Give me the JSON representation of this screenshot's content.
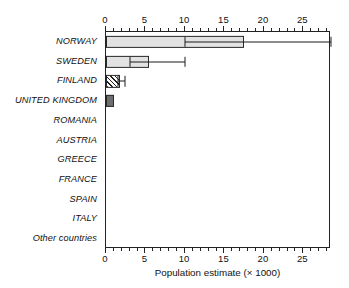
{
  "chart_data": {
    "type": "bar",
    "orientation": "horizontal",
    "title": "",
    "xlabel": "Population estimate (× 1000)",
    "ylabel": "",
    "xlim": [
      0,
      28.5
    ],
    "xticks": [
      0,
      5,
      10,
      15,
      20,
      25
    ],
    "xtick_labels": [
      "0",
      "5",
      "10",
      "15",
      "20",
      "25"
    ],
    "minor_tick_step": 1,
    "grid": false,
    "legend": "none",
    "axis_top": true,
    "axis_bottom": true,
    "categories": [
      "NORWAY",
      "SWEDEN",
      "FINLAND",
      "UNITED KINGDOM",
      "ROMANIA",
      "AUSTRIA",
      "GREECE",
      "FRANCE",
      "SPAIN",
      "ITALY",
      "Other countries"
    ],
    "values": [
      17.5,
      5.5,
      1.8,
      1.0,
      0,
      0,
      0,
      0,
      0,
      0,
      0
    ],
    "error_low": [
      10.0,
      3.0,
      1.5,
      null,
      null,
      null,
      null,
      null,
      null,
      null,
      null
    ],
    "error_high": [
      28.5,
      10.0,
      2.4,
      null,
      null,
      null,
      null,
      null,
      null,
      null,
      null
    ],
    "bar_styles": [
      "light-gray",
      "light-gray",
      "diagonal-hatch",
      "dark-gray",
      "none",
      "none",
      "none",
      "none",
      "none",
      "none",
      "none"
    ],
    "colors": {
      "light_bar": "#e2e2e2",
      "dark_bar": "#6e6e6e",
      "hatch_line": "#1f1f1f",
      "axis": "#222222",
      "background": "#ffffff",
      "text": "#111111"
    }
  }
}
